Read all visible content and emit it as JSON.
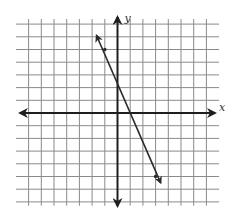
{
  "chart_data": {
    "type": "line",
    "title": "",
    "xlabel": "x",
    "ylabel": "y",
    "xlim": [
      -7,
      7
    ],
    "ylim": [
      -7,
      7
    ],
    "grid": true,
    "grid_step": 1,
    "tick_labels": false,
    "series": [
      {
        "name": "line",
        "equation": "y = -2.5x + 2.5",
        "slope": -2.5,
        "y_intercept": 2.5,
        "x_intercept": 1,
        "marked_points": [
          {
            "x": -1,
            "y": 5
          },
          {
            "x": 3,
            "y": -5
          }
        ],
        "arrow_endpoints": [
          {
            "x": -1.65,
            "y": 6.1
          },
          {
            "x": 3.4,
            "y": -5.5
          }
        ]
      }
    ]
  },
  "layout": {
    "origin_px": [
      117.5,
      113
    ],
    "unit_px": 12.7,
    "grid_h_extent_units": [
      -8,
      8
    ],
    "grid_v_extent_units": [
      -7.3,
      7.4
    ],
    "x_axis_px": [
      20,
      215
    ],
    "y_axis_px": [
      17,
      206
    ]
  },
  "labels": {
    "x_axis": "x",
    "y_axis": "y"
  },
  "colors": {
    "grid": "#8a8a8a",
    "axis": "#1e1e1e",
    "line": "#2a2a2a",
    "background": "#ffffff"
  }
}
